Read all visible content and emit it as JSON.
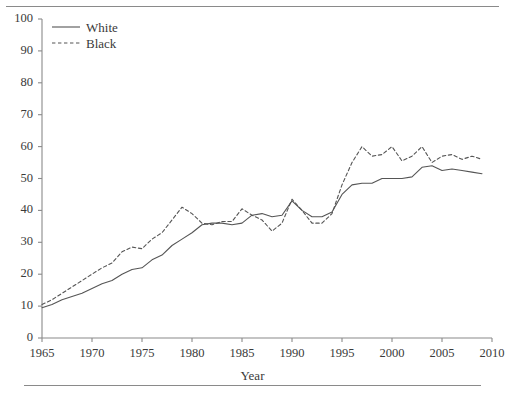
{
  "figure": {
    "top_rule": "horizontal-rule",
    "bottom_rule": "horizontal-rule"
  },
  "chart_data": {
    "type": "line",
    "title": "",
    "xlabel": "Year",
    "ylabel": "",
    "xlim": [
      1965,
      2010
    ],
    "ylim": [
      0,
      100
    ],
    "xticks": [
      1965,
      1970,
      1975,
      1980,
      1985,
      1990,
      1995,
      2000,
      2005,
      2010
    ],
    "yticks": [
      0,
      10,
      20,
      30,
      40,
      50,
      60,
      70,
      80,
      90,
      100
    ],
    "grid": false,
    "legend_position": "top-left",
    "x": [
      1965,
      1966,
      1967,
      1968,
      1969,
      1970,
      1971,
      1972,
      1973,
      1974,
      1975,
      1976,
      1977,
      1978,
      1979,
      1980,
      1981,
      1982,
      1983,
      1984,
      1985,
      1986,
      1987,
      1988,
      1989,
      1990,
      1991,
      1992,
      1993,
      1994,
      1995,
      1996,
      1997,
      1998,
      1999,
      2000,
      2001,
      2002,
      2003,
      2004,
      2005,
      2006,
      2007,
      2008,
      2009
    ],
    "series": [
      {
        "name": "White",
        "style": "solid",
        "color": "#555555",
        "values": [
          9.5,
          10.5,
          12,
          13,
          14,
          15.5,
          17,
          18,
          20,
          21.5,
          22,
          24.5,
          26,
          29,
          31,
          33,
          35.5,
          36,
          36,
          35.5,
          36,
          38.5,
          39,
          38,
          38.5,
          43,
          40,
          38,
          38,
          39.5,
          45,
          48,
          48.5,
          48.5,
          50,
          50,
          50,
          50.5,
          53.5,
          54,
          52.5,
          53,
          52.5,
          52,
          51.5
        ]
      },
      {
        "name": "Black",
        "style": "dashed",
        "color": "#555555",
        "values": [
          10.5,
          12,
          14,
          16,
          18,
          20,
          22,
          23.5,
          27,
          28.5,
          28,
          31,
          33,
          37,
          41,
          39,
          36,
          35.5,
          36.5,
          36.5,
          40.5,
          38.5,
          37,
          33.5,
          36,
          43.5,
          40,
          36,
          36,
          39,
          48,
          55,
          60,
          57,
          57.5,
          60,
          55.5,
          57,
          60,
          55,
          57,
          57.5,
          56,
          57,
          56
        ]
      }
    ]
  },
  "legend": {
    "items": [
      {
        "label": "White",
        "style": "solid"
      },
      {
        "label": "Black",
        "style": "dashed"
      }
    ]
  },
  "axis": {
    "x_title": "Year"
  }
}
